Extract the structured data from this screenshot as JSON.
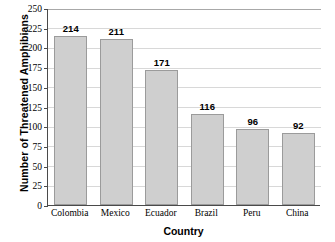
{
  "chart_data": {
    "type": "bar",
    "title": "",
    "xlabel": "Country",
    "ylabel": "Number of Threatened Amphibians",
    "categories": [
      "Colombia",
      "Mexico",
      "Ecuador",
      "Brazil",
      "Peru",
      "China"
    ],
    "values": [
      214,
      211,
      171,
      116,
      96,
      92
    ],
    "value_labels": [
      "214",
      "211",
      "171",
      "116",
      "96",
      "92"
    ],
    "ylim": [
      0,
      250
    ],
    "ytick_values": [
      0,
      25,
      50,
      75,
      100,
      125,
      150,
      175,
      200,
      225,
      250
    ],
    "ytick_labels": [
      "0",
      "25",
      "50",
      "75",
      "100",
      "125",
      "150",
      "175",
      "200",
      "225",
      "250"
    ],
    "grid": true,
    "grid_axis": "y",
    "legend": null,
    "legend_position": "none",
    "colors": {
      "bar_fill": "#cfcfcf",
      "bar_border": "#9b9b9b",
      "gridline": "#d8d8d8",
      "axis": "#4a4a4a",
      "text": "#000000",
      "background": "#ffffff"
    }
  }
}
